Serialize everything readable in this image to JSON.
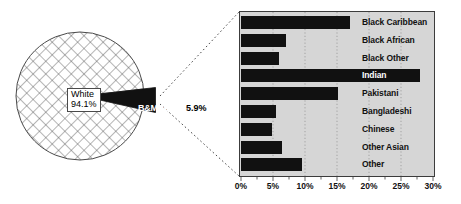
{
  "figure": {
    "pie": {
      "slices": [
        {
          "label": "White",
          "value_label": "94.1%",
          "value": 94.1,
          "fill": "crosshatch"
        },
        {
          "label": "B&MEG",
          "value_label": "5.9%",
          "value": 5.9,
          "fill": "#111111"
        }
      ],
      "exploded_slice": "B&MEG"
    },
    "connector": {
      "style": "dotted",
      "color": "#4a4a4a"
    }
  },
  "chart_data": {
    "type": "bar",
    "orientation": "horizontal",
    "title": "",
    "xlabel": "",
    "ylabel": "",
    "xlim": [
      0,
      30
    ],
    "grid": true,
    "legend": "none",
    "categories": [
      "Black Caribbean",
      "Black African",
      "Black Other",
      "Indian",
      "Pakistani",
      "Bangladeshi",
      "Chinese",
      "Other Asian",
      "Other"
    ],
    "values": [
      17.0,
      7.0,
      6.0,
      28.0,
      15.2,
      5.5,
      4.9,
      6.4,
      9.5
    ],
    "xticks": [
      0,
      5,
      10,
      15,
      20,
      25,
      30
    ],
    "xticklabels": [
      "0%",
      "5%",
      "10%",
      "15%",
      "20%",
      "25%",
      "30%"
    ],
    "bar_color": "#111111",
    "plot_background": "#d6d6d6"
  }
}
